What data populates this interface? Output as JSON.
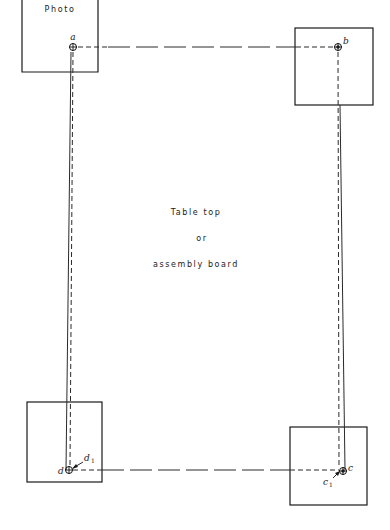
{
  "diagram": {
    "photo_label": "Photo",
    "center_text": {
      "line1": "Table top",
      "line2": "or",
      "line3": "assembly board"
    },
    "points": {
      "a": {
        "label": "a"
      },
      "b": {
        "label": "b"
      },
      "c": {
        "label": "c",
        "offset_label": "c",
        "offset_sub": "1"
      },
      "d": {
        "label": "d",
        "offset_label": "d",
        "offset_sub": "1"
      }
    },
    "colors": {
      "ink": "#1a1a1a",
      "paper": "#ffffff"
    }
  }
}
